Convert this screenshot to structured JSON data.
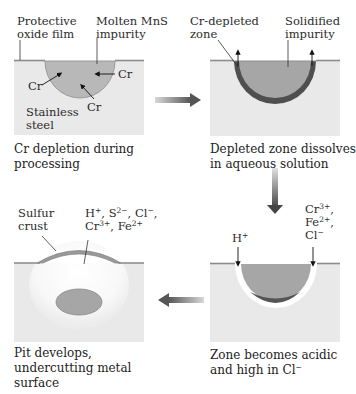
{
  "figure": {
    "colors": {
      "steel": "#e9e9e9",
      "impurity": "#a9a9a9",
      "oxide_film": "#8d8d8d",
      "depleted_zone": "#4e4e4e",
      "pit_void": "#ffffff",
      "arrow": "#555555"
    },
    "panels": [
      {
        "id": "panel-1",
        "labels": {
          "oxide_film": "Protective oxide film",
          "oxide_film_l1": "Protective",
          "oxide_film_l2": "oxide film",
          "impurity_l1": "Molten MnS",
          "impurity_l2": "impurity",
          "cr_left": "Cr",
          "cr_right": "Cr",
          "cr_bottom": "Cr",
          "steel_l1": "Stainless",
          "steel_l2": "steel"
        },
        "caption_l1": "Cr depletion during",
        "caption_l2": "processing"
      },
      {
        "id": "panel-2",
        "labels": {
          "depleted_l1": "Cr-depleted",
          "depleted_l2": "zone",
          "solid_l1": "Solidified",
          "solid_l2": "impurity"
        },
        "caption_l1": "Depleted zone dissolves",
        "caption_l2": "in aqueous solution"
      },
      {
        "id": "panel-3",
        "labels": {
          "h_plus": "H",
          "h_plus_sup": "+",
          "ions_l1": "Cr",
          "ions_l1_sup": "3+",
          "ions_l1_tail": ",",
          "ions_l2": "Fe",
          "ions_l2_sup": "2+",
          "ions_l2_tail": ",",
          "ions_l3": "Cl",
          "ions_l3_sup": "−"
        },
        "caption_l1": "Zone becomes acidic",
        "caption_l2": "and high in Cl",
        "caption_l2_sup": "−"
      },
      {
        "id": "panel-4",
        "labels": {
          "crust_l1": "Sulfur",
          "crust_l2": "crust",
          "ions_a": "H",
          "ions_a_sup": "+",
          "ions_b": ", S",
          "ions_b_sup": "2−",
          "ions_c": ", Cl",
          "ions_c_sup": "−",
          "ions_c_tail": ",",
          "ions_d": "Cr",
          "ions_d_sup": "3+",
          "ions_e": ", Fe",
          "ions_e_sup": "2+"
        },
        "caption_l1": "Pit develops,",
        "caption_l2": "undercutting metal",
        "caption_l3": "surface"
      }
    ],
    "flow_arrows": [
      {
        "from": "panel-1",
        "to": "panel-2",
        "direction": "right"
      },
      {
        "from": "panel-2",
        "to": "panel-3",
        "direction": "down"
      },
      {
        "from": "panel-3",
        "to": "panel-4",
        "direction": "left"
      }
    ]
  }
}
